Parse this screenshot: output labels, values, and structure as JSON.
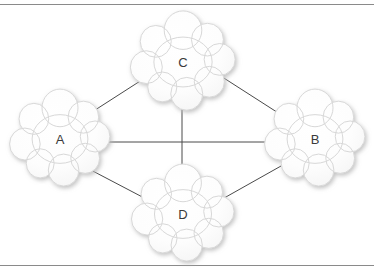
{
  "diagram": {
    "background_color": "#ffffff",
    "frame": {
      "rule_color": "#8a8a8a",
      "top_rule_y": 4,
      "bottom_rule_y": 265
    },
    "nodes": [
      {
        "id": "A",
        "label": "A",
        "shape": "cloud",
        "cx": 60,
        "cy": 139,
        "rx": 45,
        "ry": 42
      },
      {
        "id": "C",
        "label": "C",
        "shape": "cloud",
        "cx": 183,
        "cy": 62,
        "rx": 47,
        "ry": 43
      },
      {
        "id": "B",
        "label": "B",
        "shape": "cloud",
        "cx": 315,
        "cy": 139,
        "rx": 45,
        "ry": 42
      },
      {
        "id": "D",
        "label": "D",
        "shape": "cloud",
        "cx": 183,
        "cy": 214,
        "rx": 46,
        "ry": 42
      }
    ],
    "edges": [
      {
        "id": "edge-a-c",
        "from": "A",
        "to": "C",
        "x1": 92,
        "y1": 112,
        "x2": 148,
        "y2": 76
      },
      {
        "id": "edge-c-b",
        "from": "C",
        "to": "B",
        "x1": 216,
        "y1": 73,
        "x2": 283,
        "y2": 116
      },
      {
        "id": "edge-a-b",
        "from": "A",
        "to": "B",
        "x1": 92,
        "y1": 142,
        "x2": 277,
        "y2": 142
      },
      {
        "id": "edge-a-d",
        "from": "A",
        "to": "D",
        "x1": 87,
        "y1": 168,
        "x2": 150,
        "y2": 201
      },
      {
        "id": "edge-d-b",
        "from": "D",
        "to": "B",
        "x1": 217,
        "y1": 202,
        "x2": 281,
        "y2": 166
      },
      {
        "id": "edge-c-d",
        "from": "C",
        "to": "D",
        "x1": 182,
        "y1": 100,
        "x2": 182,
        "y2": 176
      }
    ],
    "edge_color": "#4a4a4a",
    "cloud_style": {
      "fill": "#fdfdfd",
      "stroke": "#d8d8d8",
      "label_color": "#3a3a3a"
    }
  }
}
